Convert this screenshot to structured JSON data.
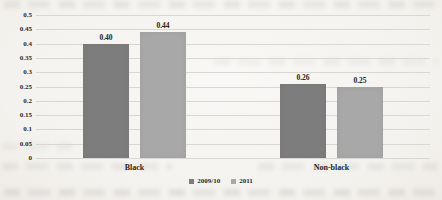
{
  "chart_data": {
    "type": "bar",
    "title": "",
    "xlabel": "",
    "ylabel": "",
    "categories": [
      "Black",
      "Non-black"
    ],
    "series": [
      {
        "name": "2009/10",
        "color": "#7d7d7d",
        "values": [
          0.4,
          0.26
        ],
        "value_labels": [
          "0.40",
          "0.26"
        ]
      },
      {
        "name": "2011",
        "color": "#a8a8a8",
        "values": [
          0.44,
          0.25
        ],
        "value_labels": [
          "0.44",
          "0.25"
        ]
      }
    ],
    "ylim": [
      0,
      0.5
    ],
    "ytick_step": 0.05,
    "ytick_labels": [
      "0",
      "0.05",
      "0.1",
      "0.15",
      "0.2",
      "0.25",
      "0.3",
      "0.35",
      "0.4",
      "0.45",
      "0.5"
    ],
    "grid": true,
    "legend_position": "bottom"
  },
  "colors": {
    "bar_2009_10": "#7d7d7d",
    "bar_2011": "#a8a8a8",
    "gridline": "#d8d7d4",
    "text": "#2b2a28",
    "paper": "#f4f2ee"
  }
}
